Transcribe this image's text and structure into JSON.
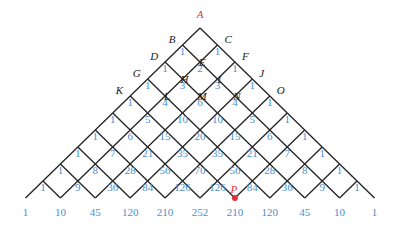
{
  "figure": {
    "apex": {
      "x": 200,
      "y": 28
    },
    "levels": 10,
    "dx": 17.45,
    "dy": 17,
    "line_color": "#222222",
    "number_color": "#4a8fd0",
    "highlight_color": "#e0323c",
    "point_labels": [
      {
        "name": "A",
        "level": 0,
        "pos": 0,
        "color": "red"
      },
      {
        "name": "B",
        "level": 1,
        "pos": 0
      },
      {
        "name": "C",
        "level": 1,
        "pos": 1
      },
      {
        "name": "D",
        "level": 2,
        "pos": 0
      },
      {
        "name": "E",
        "level": 2,
        "pos": 1
      },
      {
        "name": "F",
        "level": 2,
        "pos": 2
      },
      {
        "name": "G",
        "level": 3,
        "pos": 0
      },
      {
        "name": "H",
        "level": 3,
        "pos": 1
      },
      {
        "name": "I",
        "level": 3,
        "pos": 2
      },
      {
        "name": "J",
        "level": 3,
        "pos": 3
      },
      {
        "name": "K",
        "level": 4,
        "pos": 0
      },
      {
        "name": "L",
        "level": 4,
        "pos": 1
      },
      {
        "name": "M",
        "level": 4,
        "pos": 2
      },
      {
        "name": "N",
        "level": 4,
        "pos": 3
      },
      {
        "name": "O",
        "level": 4,
        "pos": 4
      },
      {
        "name": "P",
        "level": 10,
        "pos": 6,
        "color": "red",
        "dot": true
      }
    ],
    "rows": [
      [
        1
      ],
      [
        1,
        1
      ],
      [
        1,
        2,
        1
      ],
      [
        1,
        3,
        3,
        1
      ],
      [
        1,
        4,
        6,
        4,
        1
      ],
      [
        1,
        5,
        10,
        10,
        5,
        1
      ],
      [
        1,
        6,
        15,
        20,
        15,
        6,
        1
      ],
      [
        1,
        7,
        21,
        35,
        35,
        21,
        7,
        1
      ],
      [
        1,
        8,
        28,
        56,
        70,
        56,
        28,
        8,
        1
      ],
      [
        1,
        9,
        36,
        84,
        126,
        126,
        84,
        36,
        9,
        1
      ],
      [
        1,
        10,
        45,
        120,
        210,
        252,
        210,
        120,
        45,
        10,
        1
      ]
    ]
  }
}
